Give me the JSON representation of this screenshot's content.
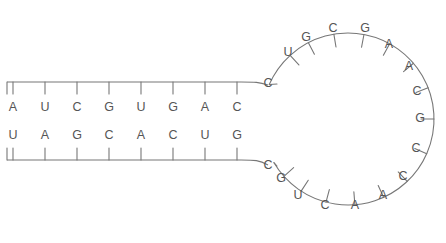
{
  "diagram": {
    "background_color": "#ffffff",
    "line_color": "#777777",
    "text_color": "#555555"
  },
  "stem": {
    "top_strand_label": "top-strand",
    "bottom_strand_label": "bottom-strand",
    "top_bases": [
      "A",
      "U",
      "C",
      "G",
      "U",
      "G",
      "A",
      "C"
    ],
    "bottom_bases": [
      "U",
      "A",
      "G",
      "C",
      "A",
      "C",
      "U",
      "G"
    ],
    "pair_count": 8,
    "first_x": 13,
    "spacing": 32,
    "top_base_y": 108,
    "bottom_base_y": 136,
    "top_backbone_y": 82,
    "bottom_backbone_y": 160
  },
  "loop": {
    "label": "loop-region",
    "center_x": 348,
    "center_y": 119,
    "radius": 86,
    "base_count": 19,
    "bases": [
      {
        "base": "C",
        "x": 268,
        "y": 84,
        "tx": 250,
        "ty": 78
      },
      {
        "base": "U",
        "x": 288,
        "y": 53,
        "tx": 272,
        "ty": 42
      },
      {
        "base": "G",
        "x": 306,
        "y": 38,
        "tx": 295,
        "ty": 23
      },
      {
        "base": "C",
        "x": 333,
        "y": 29,
        "tx": 328,
        "ty": 14
      },
      {
        "base": "G",
        "x": 365,
        "y": 29,
        "tx": 371,
        "ty": 14
      },
      {
        "base": "A",
        "x": 389,
        "y": 45,
        "tx": 401,
        "ty": 32
      },
      {
        "base": "A",
        "x": 409,
        "y": 67,
        "tx": 424,
        "ty": 58
      },
      {
        "base": "C",
        "x": 417,
        "y": 92,
        "tx": 432,
        "ty": 88
      },
      {
        "base": "G",
        "x": 420,
        "y": 119,
        "tx": 436,
        "ty": 119
      },
      {
        "base": "C",
        "x": 416,
        "y": 149,
        "tx": 431,
        "ty": 153
      },
      {
        "base": "C",
        "x": 403,
        "y": 177,
        "tx": 417,
        "ty": 187
      },
      {
        "base": "A",
        "x": 383,
        "y": 196,
        "tx": 394,
        "ty": 210
      },
      {
        "base": "A",
        "x": 355,
        "y": 206,
        "tx": 360,
        "ty": 222
      },
      {
        "base": "C",
        "x": 325,
        "y": 206,
        "tx": 322,
        "ty": 222
      },
      {
        "base": "U",
        "x": 298,
        "y": 196,
        "tx": 287,
        "ty": 210
      },
      {
        "base": "G",
        "x": 281,
        "y": 179,
        "tx": 267,
        "ty": 189
      },
      {
        "base": "C",
        "x": 268,
        "y": 166,
        "tx": 250,
        "ty": 171
      }
    ]
  }
}
